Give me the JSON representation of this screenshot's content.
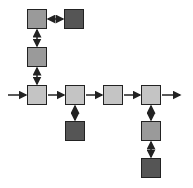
{
  "diagram": {
    "title": "",
    "colors": {
      "light": "#c4c4c4",
      "medium": "#9a9a9a",
      "dark": "#555555",
      "stroke": "#222222"
    },
    "nodes": [
      {
        "id": "top-left",
        "x": 27,
        "y": 9,
        "shade": "medium"
      },
      {
        "id": "top-right",
        "x": 64,
        "y": 9,
        "shade": "dark"
      },
      {
        "id": "mid-left",
        "x": 27,
        "y": 47,
        "shade": "medium"
      },
      {
        "id": "row-1",
        "x": 27,
        "y": 85,
        "shade": "light"
      },
      {
        "id": "row-2",
        "x": 65,
        "y": 85,
        "shade": "light"
      },
      {
        "id": "row-3",
        "x": 103,
        "y": 85,
        "shade": "light"
      },
      {
        "id": "row-4",
        "x": 141,
        "y": 85,
        "shade": "light"
      },
      {
        "id": "below-2",
        "x": 65,
        "y": 121,
        "shade": "dark"
      },
      {
        "id": "below-4a",
        "x": 141,
        "y": 121,
        "shade": "medium"
      },
      {
        "id": "below-4b",
        "x": 141,
        "y": 158,
        "shade": "dark"
      }
    ],
    "edges": [
      {
        "from": "top-left",
        "to": "top-right",
        "type": "bidirectional"
      },
      {
        "from": "top-left",
        "to": "mid-left",
        "type": "bidirectional"
      },
      {
        "from": "mid-left",
        "to": "row-1",
        "type": "bidirectional"
      },
      {
        "from": "input",
        "to": "row-1",
        "type": "directed"
      },
      {
        "from": "row-1",
        "to": "row-2",
        "type": "directed"
      },
      {
        "from": "row-2",
        "to": "row-3",
        "type": "directed"
      },
      {
        "from": "row-3",
        "to": "row-4",
        "type": "directed"
      },
      {
        "from": "row-4",
        "to": "output",
        "type": "directed"
      },
      {
        "from": "row-2",
        "to": "below-2",
        "type": "bidirectional"
      },
      {
        "from": "row-4",
        "to": "below-4a",
        "type": "bidirectional"
      },
      {
        "from": "below-4a",
        "to": "below-4b",
        "type": "bidirectional"
      }
    ]
  }
}
